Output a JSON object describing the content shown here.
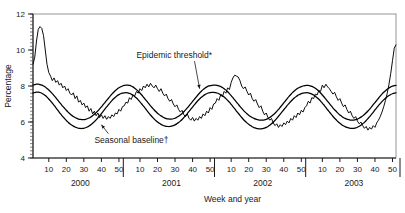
{
  "chart_data": {
    "type": "line",
    "title": "",
    "xlabel": "Week and year",
    "ylabel": "Percentage",
    "ylim": [
      4,
      12
    ],
    "ytick_labels": [
      "4",
      "6",
      "8",
      "10",
      "12"
    ],
    "ytick_values": [
      4,
      6,
      8,
      10,
      12
    ],
    "y_minor_step": 0.2,
    "grid": false,
    "legend_position": "none",
    "years": [
      "2000",
      "2001",
      "2002",
      "2003"
    ],
    "week_tick_labels": [
      "10",
      "20",
      "30",
      "40",
      "50"
    ],
    "week_tick_values": [
      10,
      20,
      30,
      40,
      50
    ],
    "weeks_per_year": 52,
    "x_range_weeks": [
      1,
      208
    ],
    "annotations": [
      {
        "name": "epidemic-threshold-annotation",
        "text": "Epidemic threshold*",
        "label_x_week": 60,
        "label_y": 9.55,
        "point_x_week": 96,
        "point_y": 7.85
      },
      {
        "name": "seasonal-baseline-annotation",
        "text": "Seasonal baseline†",
        "label_x_week": 36,
        "label_y": 4.85,
        "point_x_week": 40,
        "point_y": 5.85
      }
    ],
    "series": [
      {
        "name": "Observed percentage of deaths from pneumonia and influenza",
        "style": "jagged-weekly",
        "values": [
          9.2,
          9.6,
          10.5,
          11.15,
          11.3,
          11.2,
          10.8,
          10.0,
          9.2,
          8.75,
          8.55,
          8.3,
          8.45,
          8.2,
          8.3,
          8.05,
          8.15,
          7.9,
          8.0,
          7.75,
          7.85,
          7.6,
          7.5,
          7.62,
          7.3,
          7.45,
          7.1,
          7.2,
          6.95,
          7.05,
          6.8,
          6.9,
          6.6,
          6.75,
          6.45,
          6.6,
          6.35,
          6.5,
          6.25,
          6.4,
          6.2,
          6.35,
          6.15,
          6.3,
          6.2,
          6.4,
          6.3,
          6.5,
          6.45,
          6.7,
          6.6,
          6.85,
          6.9,
          7.1,
          7.05,
          7.35,
          7.25,
          7.5,
          7.45,
          7.7,
          7.6,
          7.85,
          7.75,
          8.0,
          7.9,
          8.1,
          7.95,
          8.15,
          8.0,
          7.9,
          8.05,
          7.85,
          7.7,
          7.85,
          7.6,
          7.45,
          7.55,
          7.3,
          7.15,
          7.25,
          7.0,
          6.85,
          6.95,
          6.7,
          6.55,
          6.65,
          6.4,
          6.3,
          6.45,
          6.2,
          6.1,
          6.25,
          6.05,
          6.2,
          6.1,
          6.3,
          6.2,
          6.45,
          6.35,
          6.6,
          6.5,
          6.8,
          6.7,
          7.0,
          7.05,
          7.3,
          7.2,
          7.5,
          7.4,
          7.7,
          7.6,
          7.9,
          7.8,
          8.2,
          8.45,
          8.6,
          8.55,
          8.5,
          8.3,
          8.0,
          7.85,
          7.95,
          7.7,
          7.5,
          7.6,
          7.3,
          7.15,
          7.25,
          7.0,
          6.8,
          6.9,
          6.6,
          6.4,
          6.5,
          6.25,
          6.1,
          6.2,
          5.95,
          5.8,
          5.9,
          5.7,
          5.85,
          5.75,
          5.95,
          5.85,
          6.05,
          5.95,
          6.2,
          6.1,
          6.35,
          6.25,
          6.5,
          6.4,
          6.65,
          6.55,
          6.8,
          6.9,
          7.15,
          7.05,
          7.35,
          7.3,
          7.55,
          7.5,
          7.75,
          7.7,
          8.05,
          7.9,
          8.1,
          7.95,
          7.85,
          7.7,
          7.55,
          7.65,
          7.4,
          7.2,
          7.3,
          7.05,
          6.85,
          6.95,
          6.7,
          6.5,
          6.6,
          6.35,
          6.2,
          6.3,
          6.05,
          5.9,
          6.0,
          5.8,
          5.65,
          5.75,
          5.55,
          5.7,
          5.6,
          5.8,
          5.7,
          5.95,
          6.1,
          6.3,
          6.55,
          6.85,
          7.2,
          7.6,
          8.1,
          8.7,
          9.4,
          10.1,
          10.3
        ]
      },
      {
        "name": "Epidemic threshold",
        "style": "smooth",
        "values": [
          8.05,
          8.08,
          8.1,
          8.1,
          8.08,
          8.05,
          8.0,
          7.94,
          7.86,
          7.78,
          7.68,
          7.58,
          7.47,
          7.35,
          7.23,
          7.11,
          6.99,
          6.87,
          6.76,
          6.65,
          6.55,
          6.46,
          6.38,
          6.31,
          6.25,
          6.2,
          6.16,
          6.14,
          6.13,
          6.13,
          6.15,
          6.18,
          6.22,
          6.28,
          6.35,
          6.43,
          6.52,
          6.62,
          6.73,
          6.84,
          6.96,
          7.08,
          7.2,
          7.32,
          7.44,
          7.55,
          7.65,
          7.75,
          7.83,
          7.9,
          7.96,
          8.0,
          8.03,
          8.05,
          8.05,
          8.03,
          8.0,
          7.95,
          7.88,
          7.8,
          7.71,
          7.61,
          7.5,
          7.38,
          7.26,
          7.14,
          7.02,
          6.9,
          6.79,
          6.68,
          6.58,
          6.49,
          6.41,
          6.34,
          6.28,
          6.23,
          6.19,
          6.17,
          6.16,
          6.16,
          6.18,
          6.21,
          6.26,
          6.32,
          6.39,
          6.47,
          6.57,
          6.67,
          6.78,
          6.9,
          7.02,
          7.14,
          7.26,
          7.38,
          7.5,
          7.61,
          7.71,
          7.8,
          7.88,
          7.94,
          7.99,
          8.02,
          8.04,
          8.05,
          8.05,
          8.04,
          8.01,
          7.97,
          7.92,
          7.85,
          7.77,
          7.68,
          7.58,
          7.47,
          7.35,
          7.23,
          7.11,
          6.99,
          6.87,
          6.76,
          6.65,
          6.55,
          6.46,
          6.38,
          6.31,
          6.25,
          6.2,
          6.16,
          6.13,
          6.11,
          6.1,
          6.1,
          6.12,
          6.15,
          6.19,
          6.25,
          6.32,
          6.4,
          6.49,
          6.59,
          6.7,
          6.82,
          6.94,
          7.06,
          7.18,
          7.3,
          7.42,
          7.53,
          7.63,
          7.72,
          7.8,
          7.87,
          7.93,
          7.97,
          8.0,
          8.02,
          8.03,
          8.03,
          8.01,
          7.98,
          7.93,
          7.87,
          7.8,
          7.71,
          7.61,
          7.5,
          7.39,
          7.27,
          7.15,
          7.03,
          6.91,
          6.79,
          6.68,
          6.58,
          6.48,
          6.39,
          6.32,
          6.25,
          6.2,
          6.16,
          6.13,
          6.11,
          6.1,
          6.11,
          6.13,
          6.16,
          6.21,
          6.27,
          6.34,
          6.42,
          6.51,
          6.61,
          6.72,
          6.84,
          6.96,
          7.08,
          7.2,
          7.32,
          7.44,
          7.55,
          7.65,
          7.74,
          7.82,
          7.89,
          7.95,
          7.99,
          8.02,
          8.04
        ]
      },
      {
        "name": "Seasonal baseline",
        "style": "smooth",
        "values": [
          7.6,
          7.64,
          7.66,
          7.66,
          7.64,
          7.6,
          7.54,
          7.47,
          7.38,
          7.28,
          7.17,
          7.05,
          6.93,
          6.8,
          6.67,
          6.54,
          6.42,
          6.3,
          6.19,
          6.08,
          5.99,
          5.9,
          5.83,
          5.77,
          5.72,
          5.68,
          5.65,
          5.64,
          5.64,
          5.65,
          5.68,
          5.72,
          5.78,
          5.85,
          5.93,
          6.02,
          6.12,
          6.23,
          6.35,
          6.47,
          6.59,
          6.72,
          6.84,
          6.96,
          7.08,
          7.19,
          7.29,
          7.38,
          7.46,
          7.52,
          7.57,
          7.6,
          7.62,
          7.63,
          7.62,
          7.59,
          7.55,
          7.49,
          7.42,
          7.33,
          7.23,
          7.12,
          7.0,
          6.88,
          6.76,
          6.63,
          6.51,
          6.39,
          6.28,
          6.18,
          6.08,
          6.0,
          5.93,
          5.87,
          5.82,
          5.78,
          5.76,
          5.75,
          5.75,
          5.77,
          5.8,
          5.84,
          5.9,
          5.97,
          6.05,
          6.14,
          6.24,
          6.35,
          6.47,
          6.59,
          6.71,
          6.83,
          6.95,
          7.07,
          7.18,
          7.28,
          7.37,
          7.45,
          7.52,
          7.57,
          7.61,
          7.63,
          7.64,
          7.64,
          7.63,
          7.61,
          7.57,
          7.52,
          7.46,
          7.39,
          7.3,
          7.2,
          7.1,
          6.98,
          6.86,
          6.74,
          6.61,
          6.49,
          6.37,
          6.25,
          6.14,
          6.04,
          5.95,
          5.87,
          5.8,
          5.74,
          5.69,
          5.66,
          5.63,
          5.62,
          5.62,
          5.63,
          5.66,
          5.7,
          5.75,
          5.82,
          5.9,
          5.99,
          6.09,
          6.2,
          6.32,
          6.44,
          6.56,
          6.68,
          6.8,
          6.92,
          7.03,
          7.14,
          7.24,
          7.33,
          7.41,
          7.48,
          7.53,
          7.58,
          7.61,
          7.62,
          7.63,
          7.62,
          7.59,
          7.55,
          7.5,
          7.43,
          7.35,
          7.26,
          7.16,
          7.05,
          6.93,
          6.81,
          6.68,
          6.56,
          6.44,
          6.32,
          6.21,
          6.11,
          6.01,
          5.93,
          5.85,
          5.79,
          5.74,
          5.7,
          5.67,
          5.65,
          5.64,
          5.65,
          5.67,
          5.71,
          5.76,
          5.82,
          5.9,
          5.98,
          6.08,
          6.19,
          6.3,
          6.42,
          6.54,
          6.67,
          6.79,
          6.91,
          7.02,
          7.13,
          7.23,
          7.32,
          7.4,
          7.47,
          7.53,
          7.57,
          7.6,
          7.62
        ]
      }
    ]
  }
}
